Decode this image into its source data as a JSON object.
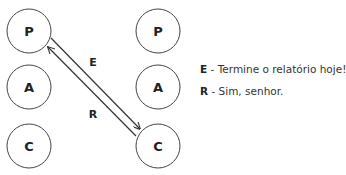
{
  "diagram": {
    "left_column": [
      {
        "label": "P"
      },
      {
        "label": "A"
      },
      {
        "label": "C"
      }
    ],
    "right_column": [
      {
        "label": "P"
      },
      {
        "label": "A"
      },
      {
        "label": "C"
      }
    ],
    "edges": [
      {
        "label": "E",
        "from": "left.P",
        "to": "right.C"
      },
      {
        "label": "R",
        "from": "right.C",
        "to": "left.P"
      }
    ],
    "legend": [
      {
        "key": "E",
        "separator": " - ",
        "text": "Termine o relatório hoje!"
      },
      {
        "key": "R",
        "separator": " - ",
        "text": "Sim, senhor."
      }
    ],
    "colors": {
      "stroke": "#333333",
      "text": "#222222",
      "background": "#ffffff"
    }
  }
}
